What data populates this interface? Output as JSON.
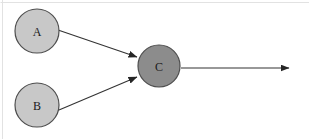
{
  "figure": {
    "type": "node-link-diagram",
    "background_color": "#ffffff",
    "width": 309,
    "height": 139,
    "frame": {
      "color": "#e2e2e2",
      "top_edge": true,
      "left_edge": true
    }
  },
  "nodes": [
    {
      "id": "A",
      "label": "A",
      "cx": 37,
      "cy": 31,
      "r": 22,
      "fill": "#c8c8c8",
      "stroke": "#4d4d4d",
      "text_color": "#1a1a1a"
    },
    {
      "id": "B",
      "label": "B",
      "cx": 37,
      "cy": 105,
      "r": 22,
      "fill": "#c8c8c8",
      "stroke": "#4d4d4d",
      "text_color": "#1a1a1a"
    },
    {
      "id": "C",
      "label": "C",
      "cx": 159,
      "cy": 66,
      "r": 21,
      "fill": "#8c8c8c",
      "stroke": "#4d4d4d",
      "text_color": "#1a1a1a"
    }
  ],
  "edges": [
    {
      "id": "edge-a-c",
      "from": "A",
      "to": "C",
      "label": "",
      "x1": 58,
      "y1": 30,
      "x2": 137,
      "y2": 57,
      "arrowhead": true,
      "color": "#333333"
    },
    {
      "id": "edge-b-c",
      "from": "B",
      "to": "C",
      "label": "",
      "x1": 59,
      "y1": 110,
      "x2": 137,
      "y2": 77,
      "arrowhead": true,
      "color": "#333333"
    },
    {
      "id": "edge-c-out",
      "from": "C",
      "to": "",
      "label": "",
      "x1": 181,
      "y1": 68,
      "x2": 289,
      "y2": 68,
      "arrowhead": true,
      "color": "#333333"
    }
  ]
}
